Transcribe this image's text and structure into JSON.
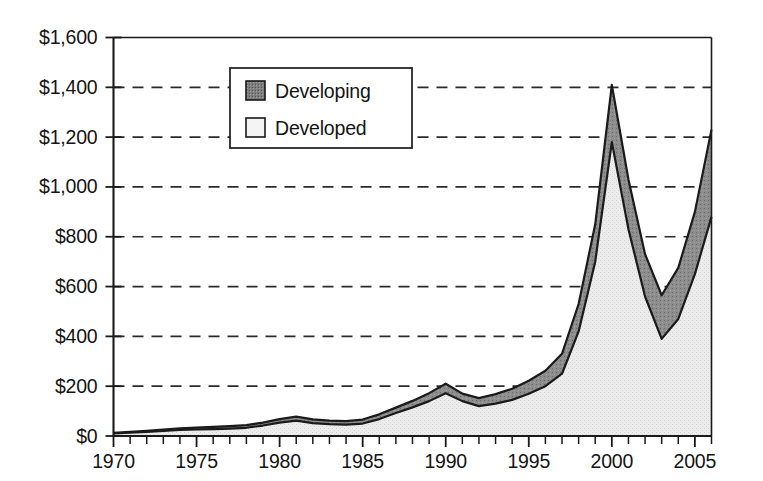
{
  "chart_data": {
    "type": "area",
    "stacked": true,
    "title": "",
    "subtitle": "",
    "xlabel": "",
    "ylabel": "",
    "x": [
      1970,
      1971,
      1972,
      1973,
      1974,
      1975,
      1976,
      1977,
      1978,
      1979,
      1980,
      1981,
      1982,
      1983,
      1984,
      1985,
      1986,
      1987,
      1988,
      1989,
      1990,
      1991,
      1992,
      1993,
      1994,
      1995,
      1996,
      1997,
      1998,
      1999,
      2000,
      2001,
      2002,
      2003,
      2004,
      2005,
      2006
    ],
    "series": [
      {
        "name": "Developed",
        "color": "#e8e8e8",
        "pattern": "light-stipple",
        "values": [
          10,
          13,
          16,
          20,
          24,
          26,
          28,
          30,
          33,
          42,
          54,
          62,
          52,
          48,
          46,
          50,
          68,
          92,
          115,
          140,
          172,
          140,
          120,
          130,
          145,
          170,
          200,
          250,
          420,
          700,
          1180,
          830,
          560,
          390,
          470,
          650,
          880
        ]
      },
      {
        "name": "Developing",
        "color": "#8a8a8a",
        "pattern": "dark-stipple",
        "values": [
          3,
          4,
          5,
          6,
          7,
          8,
          9,
          10,
          11,
          12,
          14,
          16,
          15,
          14,
          14,
          16,
          19,
          22,
          26,
          32,
          38,
          30,
          32,
          38,
          45,
          52,
          62,
          80,
          110,
          150,
          230,
          200,
          170,
          175,
          205,
          250,
          350
        ]
      }
    ],
    "totals": [
      13,
      17,
      21,
      26,
      31,
      34,
      37,
      40,
      44,
      54,
      68,
      78,
      67,
      62,
      60,
      66,
      87,
      114,
      141,
      172,
      210,
      170,
      152,
      168,
      190,
      222,
      262,
      330,
      530,
      850,
      1410,
      1030,
      730,
      565,
      675,
      900,
      1230
    ],
    "ylim": [
      0,
      1600
    ],
    "ytick_step": 200,
    "ytick_labels": [
      "$1,600",
      "$1,400",
      "$1,200",
      "$1,000",
      "$800",
      "$600",
      "$400",
      "$200",
      "$0"
    ],
    "ytick_values": [
      1600,
      1400,
      1200,
      1000,
      800,
      600,
      400,
      200,
      0
    ],
    "xlim": [
      1970,
      2006
    ],
    "xtick_labels": [
      "1970",
      "1975",
      "1980",
      "1985",
      "1990",
      "1995",
      "2000",
      "2005"
    ],
    "xtick_values": [
      1970,
      1975,
      1980,
      1985,
      1990,
      1995,
      2000,
      2005
    ],
    "xtick_minor_step": 1,
    "grid": "horizontal-dashed",
    "legend_position": "top-center-left",
    "legend": [
      {
        "label": "Developing",
        "color": "#8a8a8a"
      },
      {
        "label": "Developed",
        "color": "#f2f2f2"
      }
    ]
  },
  "colors": {
    "axis": "#1a1a1a",
    "grid": "#2b2b2b",
    "developing": "#8a8a8a",
    "developed": "#e8e8e8",
    "background": "#ffffff"
  }
}
